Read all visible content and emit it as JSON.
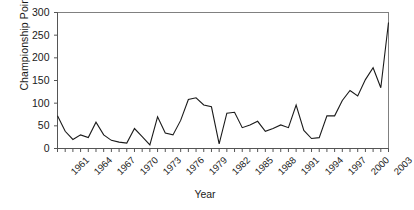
{
  "chart_data": {
    "type": "line",
    "title": "",
    "xlabel": "Year",
    "ylabel": "Championship Points",
    "xlim": [
      1961,
      2004
    ],
    "ylim": [
      0,
      300
    ],
    "ytick_values": [
      0,
      50,
      100,
      150,
      200,
      250,
      300
    ],
    "ytick_labels": [
      "0",
      "50",
      "100",
      "150",
      "200",
      "250",
      "300"
    ],
    "xtick_values": [
      1961,
      1964,
      1967,
      1970,
      1973,
      1976,
      1979,
      1982,
      1985,
      1988,
      1991,
      1994,
      1997,
      2000,
      2003
    ],
    "xtick_labels": [
      "1961",
      "1964",
      "1967",
      "1970",
      "1973",
      "1976",
      "1979",
      "1982",
      "1985",
      "1988",
      "1991",
      "1994",
      "1997",
      "2000",
      "2003"
    ],
    "grid": false,
    "legend": false,
    "line_color": "#1a1a1a",
    "frame_color": "#808080",
    "x": [
      1961,
      1962,
      1963,
      1964,
      1965,
      1966,
      1967,
      1968,
      1969,
      1970,
      1971,
      1972,
      1973,
      1974,
      1975,
      1976,
      1977,
      1978,
      1979,
      1980,
      1981,
      1982,
      1983,
      1984,
      1985,
      1986,
      1987,
      1988,
      1989,
      1990,
      1991,
      1992,
      1993,
      1994,
      1995,
      1996,
      1997,
      1998,
      1999,
      2000,
      2001,
      2002,
      2003,
      2004
    ],
    "values": [
      72,
      38,
      20,
      30,
      24,
      58,
      30,
      18,
      14,
      12,
      44,
      26,
      8,
      70,
      34,
      30,
      62,
      108,
      112,
      96,
      92,
      10,
      78,
      80,
      46,
      52,
      60,
      38,
      44,
      52,
      46,
      96,
      40,
      22,
      24,
      72,
      72,
      106,
      128,
      116,
      152,
      178,
      134,
      278
    ],
    "series": [
      {
        "name": "Championship Points",
        "values": [
          72,
          38,
          20,
          30,
          24,
          58,
          30,
          18,
          14,
          12,
          44,
          26,
          8,
          70,
          34,
          30,
          62,
          108,
          112,
          96,
          92,
          10,
          78,
          80,
          46,
          52,
          60,
          38,
          44,
          52,
          46,
          96,
          40,
          22,
          24,
          72,
          72,
          106,
          128,
          116,
          152,
          178,
          134,
          278
        ]
      }
    ]
  }
}
